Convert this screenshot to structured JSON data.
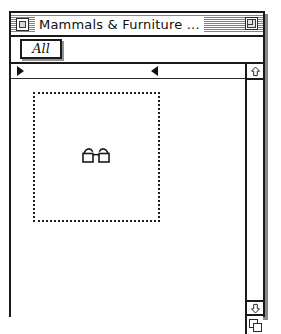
{
  "window": {
    "title": "Mammals & Furniture ...",
    "close_box": "close-box",
    "zoom_box": "zoom-box"
  },
  "tabs": [
    {
      "label": "All",
      "selected": true
    }
  ],
  "ruler": {
    "markers": [
      {
        "name": "left-margin-marker",
        "direction": "right",
        "x": 6
      },
      {
        "name": "right-margin-marker",
        "direction": "left",
        "x": 140
      }
    ]
  },
  "canvas": {
    "selection": {
      "name": "selection-rectangle",
      "style": "dotted"
    },
    "icon": {
      "name": "glasses-icon",
      "label": "glasses"
    }
  },
  "scrollbar": {
    "up_arrow": "⇧",
    "down_arrow": "⇩",
    "grow_box": "grow-box"
  },
  "colors": {
    "ink": "#1a1a1a",
    "paper": "#ffffff",
    "shadow": "#8c8c8c"
  }
}
